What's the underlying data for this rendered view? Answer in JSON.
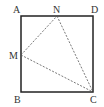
{
  "diagram": {
    "type": "geometry",
    "shape": "square",
    "points": {
      "A": {
        "label": "A",
        "x": 21,
        "y": 16
      },
      "B": {
        "label": "B",
        "x": 21,
        "y": 92
      },
      "C": {
        "label": "C",
        "x": 93,
        "y": 92
      },
      "D": {
        "label": "D",
        "x": 93,
        "y": 16
      },
      "M": {
        "label": "M",
        "x": 21,
        "y": 55
      },
      "N": {
        "label": "N",
        "x": 57,
        "y": 16
      }
    },
    "solid_segments": [
      "AB",
      "BC",
      "CD",
      "DA"
    ],
    "dashed_segments": [
      "MN",
      "NC",
      "MC"
    ],
    "colors": {
      "stroke": "#222222",
      "dashed": "#555555",
      "text": "#333333"
    }
  }
}
